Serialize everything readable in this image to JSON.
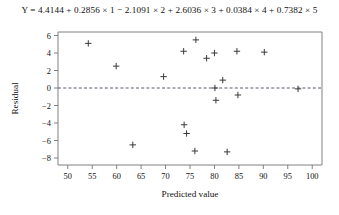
{
  "figure": {
    "equation": "Y = 4.4144 + 0.2856 × 1 − 2.1091 × 2 + 2.6036 × 3 + 0.0384 × 4 + 0.7382 × 5",
    "marker_symbol": "plus",
    "marker_color": "#3a3a3a",
    "axis_color": "#808080",
    "zeroline_color": "#5a5a6e",
    "background_color": "#ffffff"
  },
  "chart_data": {
    "type": "scatter",
    "title": "Y = 4.4144 + 0.2856 × 1 − 2.1091 × 2 + 2.6036 × 3 + 0.0384 × 4 + 0.7382 × 5",
    "xlabel": "Predicted value",
    "ylabel": "Residual",
    "xlim": [
      48,
      102
    ],
    "ylim": [
      -8.8,
      6.4
    ],
    "xticks": [
      50,
      55,
      60,
      65,
      70,
      75,
      80,
      85,
      90,
      95,
      100
    ],
    "xticklabels": [
      "50",
      "55",
      "60",
      "65",
      "70",
      "75",
      "80",
      "85",
      "90",
      "95",
      "100"
    ],
    "yticks": [
      6,
      4,
      2,
      0,
      -2,
      -4,
      -6,
      -8
    ],
    "yticklabels": [
      "6",
      "4",
      "2",
      "0",
      "−2",
      "−4",
      "−6",
      "−8"
    ],
    "grid": false,
    "legend": null,
    "reference_line": {
      "orientation": "horizontal",
      "y": 0,
      "style": "dashed"
    },
    "points": [
      {
        "x": 54.2,
        "y": 5.1
      },
      {
        "x": 59.9,
        "y": 2.5
      },
      {
        "x": 63.3,
        "y": -6.5
      },
      {
        "x": 69.6,
        "y": 1.3
      },
      {
        "x": 73.7,
        "y": 4.2
      },
      {
        "x": 73.8,
        "y": -4.2
      },
      {
        "x": 74.3,
        "y": -5.2
      },
      {
        "x": 76.2,
        "y": 5.5
      },
      {
        "x": 76.0,
        "y": -7.2
      },
      {
        "x": 78.4,
        "y": 3.4
      },
      {
        "x": 80.0,
        "y": 4.0
      },
      {
        "x": 80.1,
        "y": 0.0
      },
      {
        "x": 80.3,
        "y": -1.4
      },
      {
        "x": 81.7,
        "y": 0.9
      },
      {
        "x": 82.6,
        "y": -7.3
      },
      {
        "x": 84.6,
        "y": 4.2
      },
      {
        "x": 84.8,
        "y": -0.8
      },
      {
        "x": 90.2,
        "y": 4.1
      },
      {
        "x": 97.1,
        "y": -0.1
      }
    ]
  }
}
